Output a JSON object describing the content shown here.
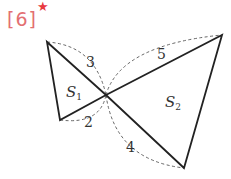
{
  "problem": {
    "number": "[6]",
    "marker": "★",
    "number_color": "#e36f72",
    "marker_color": "#e8393f"
  },
  "figure": {
    "vertices": {
      "A": [
        47,
        42
      ],
      "B": [
        60,
        120
      ],
      "O": [
        106,
        95
      ],
      "C": [
        222,
        35
      ],
      "D": [
        184,
        168
      ]
    },
    "regions": [
      {
        "name": "S1",
        "base": "S",
        "sub": "1",
        "pos": [
          66,
          92
        ]
      },
      {
        "name": "S2",
        "base": "S",
        "sub": "2",
        "pos": [
          165,
          104
        ]
      }
    ],
    "lengths": [
      {
        "segment": "OA",
        "value": "3",
        "pos": [
          89,
          64
        ]
      },
      {
        "segment": "OC",
        "value": "5",
        "pos": [
          160,
          56
        ]
      },
      {
        "segment": "OB",
        "value": "2",
        "pos": [
          87,
          125
        ]
      },
      {
        "segment": "OD",
        "value": "4",
        "pos": [
          130,
          148
        ]
      }
    ]
  }
}
